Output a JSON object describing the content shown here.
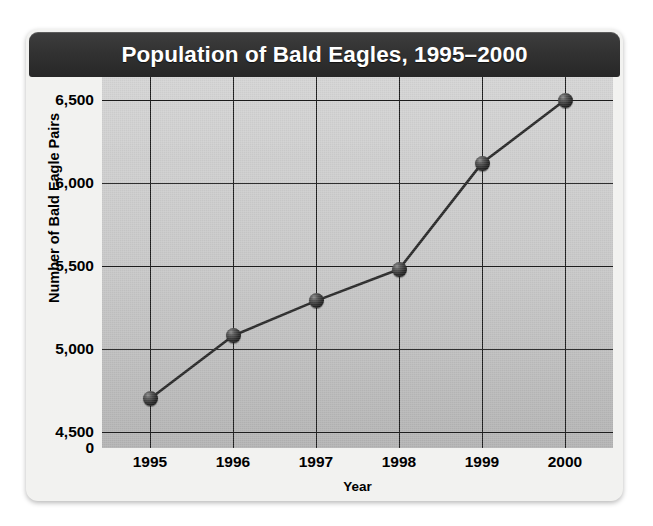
{
  "chart_data": {
    "type": "line",
    "title": "Population of Bald Eagles, 1995–2000",
    "xlabel": "Year",
    "ylabel": "Number of Bald Eagle Pairs",
    "categories": [
      "1995",
      "1996",
      "1997",
      "1998",
      "1999",
      "2000"
    ],
    "values": [
      4700,
      5080,
      5290,
      5480,
      6120,
      6500
    ],
    "series": [
      {
        "name": "Number of Bald Eagle Pairs",
        "values": [
          4700,
          5080,
          5290,
          5480,
          6120,
          6500
        ]
      }
    ],
    "ytick_labels": [
      "6,500",
      "6,000",
      "5,500",
      "5,000",
      "4,500",
      "0"
    ],
    "ytick_values": [
      6500,
      6000,
      5500,
      5000,
      4500,
      0
    ],
    "ylim": [
      4250,
      6650
    ],
    "axis_break": true,
    "grid": true,
    "legend": "none",
    "marker_color": "#1a1a1a",
    "line_color": "#2b2b2b",
    "title_bar_color": "#323232",
    "plot_background_color": "#c8c8c8"
  }
}
